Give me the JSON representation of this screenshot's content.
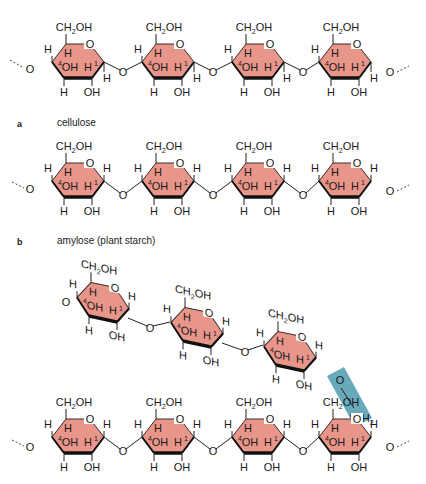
{
  "panels": [
    {
      "letter": "a",
      "caption": "cellulose",
      "linkage": "beta-1,4",
      "units": 4
    },
    {
      "letter": "b",
      "caption": "amylose (plant starch)",
      "linkage": "alpha-1,4",
      "units": 4
    },
    {
      "letter": "",
      "caption": "",
      "linkage": "alpha-1,4 main chain with alpha-1,6 branch",
      "units": 7
    }
  ],
  "atoms": {
    "ch2oh": "CH2OH",
    "oh": "OH",
    "h": "H",
    "o": "O",
    "c1": "1",
    "c4": "4",
    "c6": "6",
    "ch2": "CH2"
  },
  "colors": {
    "ring_fill": "#E8958A",
    "ring_stroke": "#3a2a2a",
    "branch_highlight": "#4E9BAE",
    "text": "#1a1a1a"
  }
}
